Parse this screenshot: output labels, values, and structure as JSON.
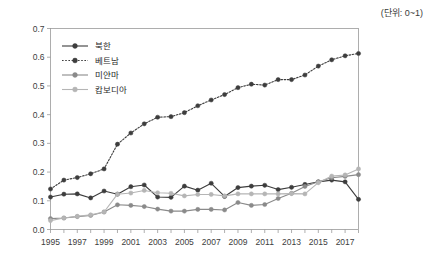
{
  "unit_note": "(단위: 0~1)",
  "chart_data": {
    "type": "line",
    "title": "",
    "xlabel": "",
    "ylabel": "",
    "xlim": [
      1995,
      2018
    ],
    "ylim": [
      0.0,
      0.7
    ],
    "grid": false,
    "legend_position": "top-left",
    "x": [
      1995,
      1996,
      1997,
      1998,
      1999,
      2000,
      2001,
      2002,
      2003,
      2004,
      2005,
      2006,
      2007,
      2008,
      2009,
      2010,
      2011,
      2012,
      2013,
      2014,
      2015,
      2016,
      2017,
      2018
    ],
    "xtick_labels": [
      "1995",
      "1997",
      "1999",
      "2001",
      "2003",
      "2005",
      "2007",
      "2009",
      "2011",
      "2013",
      "2015",
      "2017"
    ],
    "xtick_values": [
      1995,
      1997,
      1999,
      2001,
      2003,
      2005,
      2007,
      2009,
      2011,
      2013,
      2015,
      2017
    ],
    "ytick_labels": [
      "0.0",
      "0.1",
      "0.2",
      "0.3",
      "0.4",
      "0.5",
      "0.6",
      "0.7"
    ],
    "ytick_values": [
      0.0,
      0.1,
      0.2,
      0.3,
      0.4,
      0.5,
      0.6,
      0.7
    ],
    "series": [
      {
        "name": "북한",
        "color": "#3d3d3d",
        "line_style": "solid",
        "marker": "circle",
        "values": [
          0.113,
          0.123,
          0.124,
          0.11,
          0.134,
          0.123,
          0.149,
          0.155,
          0.113,
          0.112,
          0.151,
          0.137,
          0.161,
          0.115,
          0.146,
          0.151,
          0.154,
          0.139,
          0.147,
          0.157,
          0.166,
          0.172,
          0.166,
          0.105
        ]
      },
      {
        "name": "베트남",
        "color": "#3d3d3d",
        "line_style": "dotted",
        "marker": "circle",
        "values": [
          0.141,
          0.172,
          0.181,
          0.194,
          0.211,
          0.297,
          0.336,
          0.368,
          0.391,
          0.393,
          0.407,
          0.431,
          0.451,
          0.47,
          0.494,
          0.506,
          0.503,
          0.522,
          0.522,
          0.538,
          0.569,
          0.591,
          0.605,
          0.613
        ]
      },
      {
        "name": "미얀마",
        "color": "#8a8a8a",
        "line_style": "solid",
        "marker": "circle",
        "values": [
          0.038,
          0.04,
          0.045,
          0.049,
          0.061,
          0.086,
          0.084,
          0.08,
          0.071,
          0.064,
          0.064,
          0.07,
          0.07,
          0.068,
          0.094,
          0.084,
          0.087,
          0.108,
          0.126,
          0.15,
          0.166,
          0.18,
          0.185,
          0.191
        ]
      },
      {
        "name": "캄보디아",
        "color": "#b5b5b5",
        "line_style": "solid",
        "marker": "circle",
        "values": [
          0.031,
          0.04,
          0.046,
          0.051,
          0.061,
          0.123,
          0.127,
          0.136,
          0.128,
          0.126,
          0.117,
          0.122,
          0.122,
          0.117,
          0.124,
          0.124,
          0.124,
          0.124,
          0.125,
          0.124,
          0.163,
          0.186,
          0.19,
          0.211
        ]
      }
    ]
  }
}
